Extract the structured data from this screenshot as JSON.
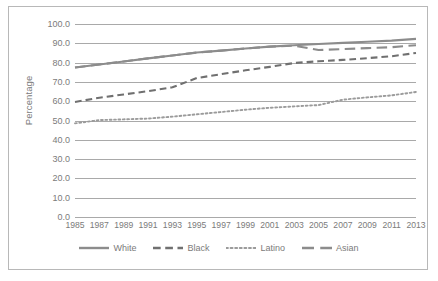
{
  "chart_data": {
    "type": "line",
    "title": "",
    "xlabel": "",
    "ylabel": "Percentage",
    "ylim": [
      0,
      100
    ],
    "ytick_step": 10,
    "grid": true,
    "legend_position": "bottom",
    "x": [
      1985,
      1987,
      1989,
      1991,
      1993,
      1995,
      1997,
      1999,
      2001,
      2003,
      2005,
      2007,
      2009,
      2011,
      2013
    ],
    "categories": [
      "1985",
      "1987",
      "1989",
      "1991",
      "1993",
      "1995",
      "1997",
      "1999",
      "2001",
      "2003",
      "2005",
      "2007",
      "2009",
      "2011",
      "2013"
    ],
    "ytick_labels": [
      "100.0",
      "90.0",
      "80.0",
      "70.0",
      "60.0",
      "50.0",
      "40.0",
      "30.0",
      "20.0",
      "10.0",
      "0.0"
    ],
    "ytick_values": [
      100,
      90,
      80,
      70,
      60,
      50,
      40,
      30,
      20,
      10,
      0
    ],
    "series": [
      {
        "name": "White",
        "style": "solid",
        "color": "#8c8c8c",
        "values": [
          77.5,
          79.0,
          80.6,
          82.2,
          83.7,
          85.2,
          86.2,
          87.3,
          88.3,
          89.0,
          89.6,
          90.2,
          90.8,
          91.4,
          92.3
        ]
      },
      {
        "name": "Black",
        "style": "dashed",
        "color": "#707070",
        "values": [
          59.6,
          61.8,
          63.5,
          65.2,
          67.2,
          72.0,
          74.0,
          76.0,
          77.8,
          79.8,
          80.7,
          81.4,
          82.3,
          83.3,
          85.0
        ]
      },
      {
        "name": "Latino",
        "style": "dotted",
        "color": "#9b9b9b",
        "values": [
          48.5,
          50.2,
          50.6,
          51.0,
          52.0,
          53.2,
          54.4,
          55.6,
          56.6,
          57.3,
          58.0,
          60.8,
          62.0,
          63.0,
          64.8
        ]
      },
      {
        "name": "Asian",
        "style": "longdash",
        "color": "#8c8c8c",
        "values": [
          77.5,
          79.0,
          80.6,
          82.2,
          83.7,
          85.2,
          86.2,
          87.3,
          88.3,
          88.8,
          86.5,
          87.0,
          87.5,
          88.0,
          89.0
        ]
      }
    ]
  }
}
